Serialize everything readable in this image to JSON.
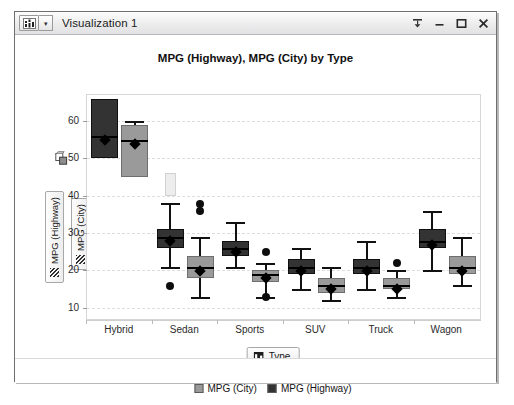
{
  "window": {
    "title": "Visualization 1",
    "menu_icon": "chart-glyph-icon",
    "caret": "▾",
    "controls": [
      {
        "name": "pin-button",
        "glyph": "pin"
      },
      {
        "name": "minimize-button",
        "glyph": "minimize"
      },
      {
        "name": "maximize-button",
        "glyph": "maximize"
      },
      {
        "name": "close-button",
        "glyph": "close"
      }
    ]
  },
  "axes": {
    "y_fields": [
      {
        "label": "MPG (Highway)",
        "icon": "grip-handle-icon"
      },
      {
        "label": "MPG (City)",
        "icon": "grip-handle-icon"
      }
    ],
    "y_lock_icon": "axis-lock-icon",
    "x_field": {
      "label": "Type",
      "icon": "category-icon"
    }
  },
  "legend": {
    "handle": "·····",
    "items": [
      {
        "label": "MPG (City)",
        "color": "#9a9a9a"
      },
      {
        "label": "MPG (Highway)",
        "color": "#333333"
      }
    ]
  },
  "chart_data": {
    "type": "box",
    "title": "MPG (Highway), MPG (City) by Type",
    "xlabel": "Type",
    "ylabel": "MPG (Highway) / MPG (City)",
    "categories": [
      "Hybrid",
      "Sedan",
      "Sports",
      "SUV",
      "Truck",
      "Wagon"
    ],
    "ylim": [
      7,
      67
    ],
    "yticks": [
      10,
      20,
      30,
      40,
      50,
      60
    ],
    "grid": true,
    "legend_position": "bottom",
    "colors": {
      "highway": "#333333",
      "city": "#9a9a9a",
      "selection": "#ededed"
    },
    "series": [
      {
        "name": "MPG (Highway)",
        "color": "#333333",
        "boxes": [
          {
            "category": "Hybrid",
            "min": 66,
            "q1": 50,
            "median": 56,
            "q3": 66,
            "max": 66,
            "outliers": []
          },
          {
            "category": "Sedan",
            "min": 21,
            "q1": 26,
            "median": 29,
            "q3": 31,
            "max": 38,
            "outliers": [
              17
            ],
            "selection": {
              "from": 40,
              "to": 46
            }
          },
          {
            "category": "Sports",
            "min": 21,
            "q1": 24,
            "median": 26,
            "q3": 28,
            "max": 33,
            "outliers": []
          },
          {
            "category": "SUV",
            "min": 15,
            "q1": 19,
            "median": 21,
            "q3": 23,
            "max": 26,
            "outliers": []
          },
          {
            "category": "Truck",
            "min": 15,
            "q1": 19,
            "median": 21,
            "q3": 23,
            "max": 28,
            "outliers": []
          },
          {
            "category": "Wagon",
            "min": 20,
            "q1": 26,
            "median": 28,
            "q3": 31,
            "max": 36,
            "outliers": []
          }
        ]
      },
      {
        "name": "MPG (City)",
        "color": "#9a9a9a",
        "boxes": [
          {
            "category": "Hybrid",
            "min": 45,
            "q1": 45,
            "median": 55,
            "q3": 59,
            "max": 60,
            "outliers": []
          },
          {
            "category": "Sedan",
            "min": 13,
            "q1": 18,
            "median": 21,
            "q3": 24,
            "max": 29,
            "outliers": [
              37,
              39
            ]
          },
          {
            "category": "Sports",
            "min": 13,
            "q1": 17,
            "median": 19,
            "q3": 20,
            "max": 22,
            "outliers": [
              14,
              26
            ]
          },
          {
            "category": "SUV",
            "min": 12,
            "q1": 14,
            "median": 16,
            "q3": 18,
            "max": 21,
            "outliers": []
          },
          {
            "category": "Truck",
            "min": 13,
            "q1": 15,
            "median": 16,
            "q3": 18,
            "max": 20,
            "outliers": [
              23
            ]
          },
          {
            "category": "Wagon",
            "min": 16,
            "q1": 19,
            "median": 21,
            "q3": 24,
            "max": 29,
            "outliers": []
          }
        ]
      }
    ]
  }
}
